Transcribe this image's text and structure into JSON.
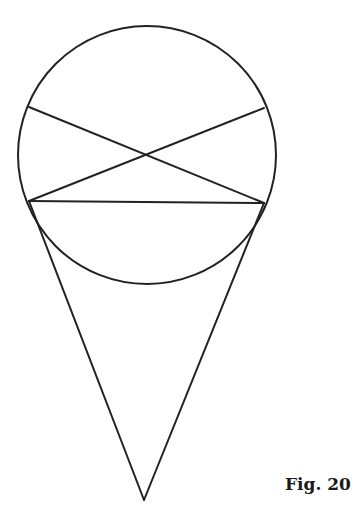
{
  "figure": {
    "caption": "Fig. 20",
    "stroke_color": "#222222",
    "stroke_width": 2,
    "circle": {
      "cx": 147,
      "cy": 155,
      "r": 129
    },
    "points": {
      "upper_left": [
        29,
        107
      ],
      "upper_right": [
        264,
        108
      ],
      "lower_left": [
        29,
        201
      ],
      "lower_right": [
        264,
        203
      ],
      "apex": [
        144,
        500
      ],
      "crossing": [
        144,
        155
      ]
    },
    "segments": [
      {
        "name": "diagonal-ul-lr",
        "from": "upper_left",
        "to": "lower_right"
      },
      {
        "name": "diagonal-ur-ll",
        "from": "upper_right",
        "to": "lower_left"
      },
      {
        "name": "horizontal-chord",
        "from": "lower_left",
        "to": "lower_right"
      },
      {
        "name": "cone-left-side",
        "from": "lower_left",
        "to": "apex"
      },
      {
        "name": "cone-right-side",
        "from": "lower_right",
        "to": "apex"
      }
    ]
  }
}
